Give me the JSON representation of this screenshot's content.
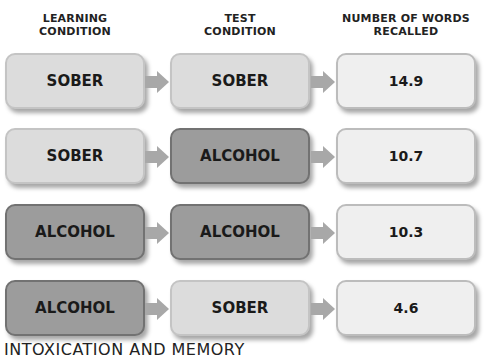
{
  "headers": {
    "learning": "LEARNING\nCONDITION",
    "test": "TEST\nCONDITION",
    "recalled": "NUMBER OF WORDS\nRECALLED"
  },
  "rows": [
    {
      "learning": "SOBER",
      "test": "SOBER",
      "recalled": "14.9"
    },
    {
      "learning": "SOBER",
      "test": "ALCOHOL",
      "recalled": "10.7"
    },
    {
      "learning": "ALCOHOL",
      "test": "ALCOHOL",
      "recalled": "10.3"
    },
    {
      "learning": "ALCOHOL",
      "test": "SOBER",
      "recalled": "4.6"
    }
  ],
  "caption": "INTOXICATION AND MEMORY",
  "colors": {
    "sober": "#dcdcdc",
    "alcohol": "#9c9c9c",
    "result": "#efefef",
    "arrow": "#a8a8a8"
  }
}
